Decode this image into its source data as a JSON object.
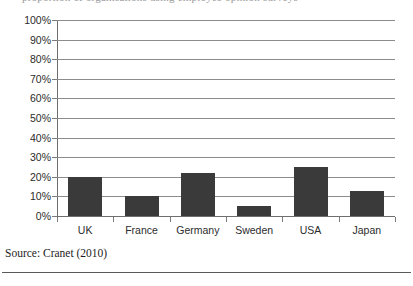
{
  "figure": {
    "cutoff_title": "proportion of organisations using employee opinion surveys",
    "source_note": "Source: Cranet (2010)"
  },
  "chart_data": {
    "type": "bar",
    "title": "",
    "xlabel": "",
    "ylabel": "",
    "categories": [
      "UK",
      "France",
      "Germany",
      "Sweden",
      "USA",
      "Japan"
    ],
    "values": [
      20,
      10,
      22,
      5,
      25,
      13
    ],
    "value_unit": "%",
    "ylim": [
      0,
      100
    ],
    "ytick_step": 10,
    "ytick_labels": [
      "0%",
      "10%",
      "20%",
      "30%",
      "40%",
      "50%",
      "60%",
      "70%",
      "80%",
      "90%",
      "100%"
    ],
    "grid": true,
    "grid_axis": "y",
    "legend": false,
    "legend_position": "none",
    "bar_color": "#3a3a3a",
    "grid_color": "#8c8c8c",
    "axis_color": "#6e6e6e",
    "background_color": "#ffffff"
  }
}
